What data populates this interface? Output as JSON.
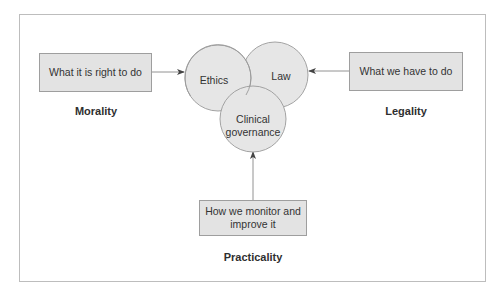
{
  "diagram": {
    "circles": [
      {
        "id": "ethics",
        "label": "Ethics",
        "cx": 218,
        "cy": 78,
        "r": 33
      },
      {
        "id": "law",
        "label": "Law",
        "cx": 275,
        "cy": 75,
        "r": 33
      },
      {
        "id": "clinical-governance",
        "label": "Clinical governance",
        "line1": "Clinical",
        "line2": "governance",
        "cx": 253,
        "cy": 118,
        "r": 33
      }
    ],
    "boxes": {
      "left": {
        "text": "What it is right to do",
        "category": "Morality"
      },
      "right": {
        "text": "What we have to do",
        "category": "Legality"
      },
      "bottom": {
        "text": "How we monitor and improve it",
        "line1": "How we monitor and",
        "line2": "improve it",
        "category": "Practicality"
      }
    },
    "arrows": [
      {
        "from": "What it is right to do",
        "to": "Ethics"
      },
      {
        "from": "What we have to do",
        "to": "Law"
      },
      {
        "from": "How we monitor and improve it",
        "to": "Clinical governance"
      }
    ],
    "colors": {
      "circle_fill": "#e6e6e6",
      "circle_stroke": "#9a9a9a",
      "box_fill": "#e3e3e3",
      "box_stroke": "#9e9e9e",
      "arrow": "#555555",
      "frame": "#bdbdbd"
    }
  }
}
